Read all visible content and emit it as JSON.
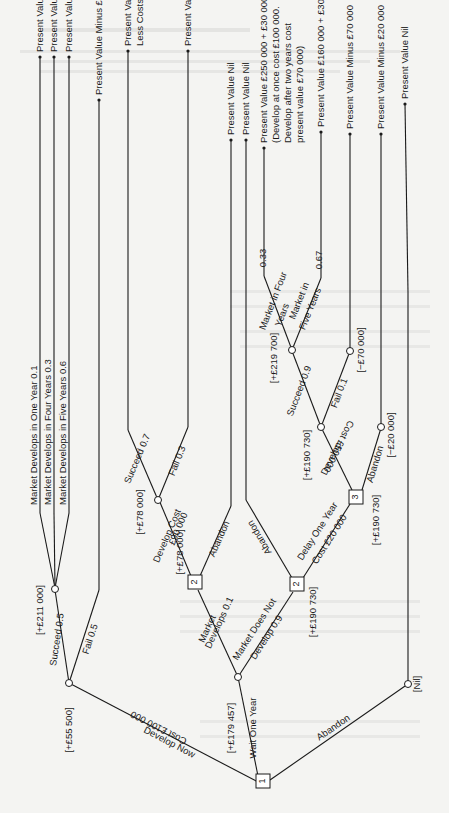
{
  "figure": {
    "orientation": "rotated-90-ccw",
    "decision_nodes": [
      {
        "id": "1",
        "label": "1"
      },
      {
        "id": "2a",
        "label": "2"
      },
      {
        "id": "2b",
        "label": "2"
      },
      {
        "id": "3",
        "label": "3"
      }
    ],
    "branches": {
      "develop_now": "Develop Now",
      "develop_now_cost": "Cost £100 000",
      "wait_one_year": "Wait One Year",
      "abandon_root": "Abandon",
      "succeed_05": "Succeed 0.5",
      "fail_05": "Fail 0.5",
      "market_develops_1y": "Market Develops in One Year 0.1",
      "market_develops_4y": "Market Develops in Four Years 0.3",
      "market_develops_5y": "Market Develops in Five Years 0.6",
      "market_develops_01_a": "Market",
      "market_develops_01_b": "Develops 0.1",
      "market_not_a": "Market Does Not",
      "market_not_b": "Develop 0.9",
      "develop_cost_a": "Develop Cost",
      "develop_cost_b": "£90 000",
      "abandon_2a": "Abandon",
      "succeed_07": "Succeed 0.7",
      "fail_03": "Fail 0.3",
      "abandon_2b": "Abandon",
      "delay_a": "Delay One Year",
      "delay_b": "Cost £20 000",
      "develop_3_a": "Develop",
      "develop_3_b": "Cost £50 000",
      "abandon_3": "Abandon",
      "succeed_09": "Succeed 0.9",
      "fail_01": "Fail 0.1",
      "market_four_a": "Market in Four",
      "market_four_b": "Years",
      "market_four_p": "0.33",
      "market_five_a": "Market in",
      "market_five_b": "Five Years",
      "market_five_p": "0.67"
    },
    "node_values": {
      "root_chance_wait": "[+£179 457]",
      "develop_now_node": "[+£55 500]",
      "succeed_node": "[+£211 000]",
      "decision_2a": "[+£78 000]",
      "succeed07_node": "[+£78 000]",
      "decision_2b": "[+£190 730]",
      "decision_3": "[+£190 730]",
      "develop3_node": "[+£190 730]",
      "succeed09_node": "[+£219 700]",
      "fail01_node": "[−£70 000]",
      "abandon3_node": "[−£20 000]",
      "abandon_root_node": "[Nil]"
    },
    "outcomes": [
      [
        "Present Value £400 000"
      ],
      [
        "Present Value £250 000"
      ],
      [
        "Present Value £160 000"
      ],
      [
        "Present Value Minus £100 000"
      ],
      [
        "Present Value of Receipts £240 000",
        "Less Costs £90 000 = £150 000"
      ],
      [
        "Present Value Minus £90 000"
      ],
      [
        "Present Value Nil"
      ],
      [
        "Present Value Nil"
      ],
      [
        "Present Value £250 000 + £30 000",
        "(Develop at once cost £100 000.",
        "Develop after two years cost",
        "present value £70 000)"
      ],
      [
        "Present Value £160 000 + £30 000"
      ],
      [
        "Present Value Minus £70 000"
      ],
      [
        "Present Value Minus £20 000"
      ],
      [
        "Present Value Nil"
      ]
    ]
  }
}
